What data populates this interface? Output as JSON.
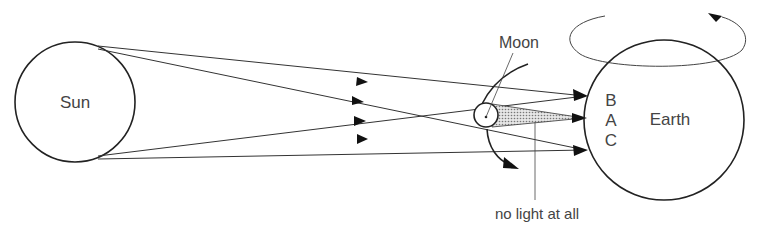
{
  "diagram": {
    "type": "solar-eclipse",
    "labels": {
      "sun": "Sun",
      "moon": "Moon",
      "earth": "Earth",
      "point_b": "B",
      "point_a": "A",
      "point_c": "C",
      "umbra_note": "no light at all"
    },
    "colors": {
      "stroke": "#222222",
      "text": "#444444",
      "umbra_fill": "#bbbbbb"
    }
  }
}
